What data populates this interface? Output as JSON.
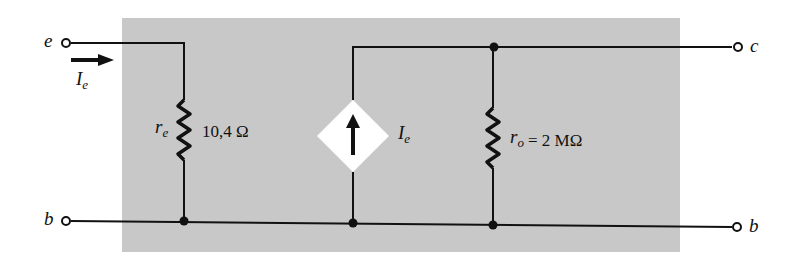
{
  "diagram": {
    "terminals": {
      "emitter": "e",
      "collector": "c",
      "base_left": "b",
      "base_right": "b"
    },
    "input_current": {
      "symbol": "I",
      "subscript": "e"
    },
    "emitter_resistor": {
      "symbol": "r",
      "subscript": "e",
      "value": "10,4 Ω"
    },
    "current_source": {
      "symbol": "I",
      "subscript": "e"
    },
    "output_resistor": {
      "symbol": "r",
      "subscript": "o",
      "value": "= 2 MΩ"
    },
    "colors": {
      "background_box": "#c8c8c8",
      "wire": "#111111",
      "source_fill": "#ffffff"
    }
  }
}
